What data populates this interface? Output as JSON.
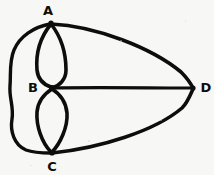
{
  "figure": {
    "kind": "hand-drawn-multigraph-diagram",
    "background_color": "#f7f7f5",
    "stroke_color": "#0d0d0d",
    "width": 214,
    "height": 175
  },
  "vertices": [
    {
      "id": "A",
      "label": "A",
      "x": 51,
      "y": 23,
      "label_x": 48,
      "label_y": 10
    },
    {
      "id": "B",
      "label": "B",
      "x": 52,
      "y": 88,
      "label_x": 33,
      "label_y": 87
    },
    {
      "id": "C",
      "label": "C",
      "x": 52,
      "y": 153,
      "label_x": 52,
      "label_y": 166
    },
    {
      "id": "D",
      "label": "D",
      "x": 193,
      "y": 88,
      "label_x": 206,
      "label_y": 87
    }
  ],
  "edges": [
    {
      "id": "AB-left",
      "from": "A",
      "to": "B",
      "shape": "arc-bulge-left",
      "path": "M51,24 C38,40 36,58 37,70 C38,80 45,85 51,87"
    },
    {
      "id": "AB-right",
      "from": "A",
      "to": "B",
      "shape": "arc-bulge-right",
      "path": "M51,24 C62,38 66,56 66,70 C66,80 59,86 52,88"
    },
    {
      "id": "BC-left",
      "from": "B",
      "to": "C",
      "shape": "arc-bulge-left",
      "path": "M52,89 C44,94 38,101 37,112 C36,126 42,143 51,152"
    },
    {
      "id": "BC-right",
      "from": "B",
      "to": "C",
      "shape": "arc-bulge-right",
      "path": "M52,89 C60,94 66,102 67,113 C68,127 60,144 52,152"
    },
    {
      "id": "AC-outer",
      "from": "A",
      "to": "C",
      "shape": "outer-left-wavy-curve",
      "path": "M50,24 C34,27 20,36 14,50 C9,62 11,74 10,86 C9,98 14,107 12,119 C10,131 14,145 26,150 C34,153 44,153 51,153"
    },
    {
      "id": "AD-top",
      "from": "A",
      "to": "D",
      "shape": "arc-bulge-up",
      "path": "M51,24 C96,26 152,48 181,72 C187,78 191,84 193,88"
    },
    {
      "id": "BD-mid",
      "from": "B",
      "to": "D",
      "shape": "straight",
      "path": "M52,88 C95,87 150,88 193,88"
    },
    {
      "id": "CD-bottom",
      "from": "C",
      "to": "D",
      "shape": "arc-bulge-down",
      "path": "M52,153 C100,148 155,131 182,108 C188,102 191,93 193,89"
    }
  ],
  "accessibility": {
    "description": "Hand-drawn multigraph with four labeled vertices A, B, C and D. A and B are joined by two parallel curved edges forming a lens; B and C are joined by two parallel curved edges forming a second lens; A connects to C by a large curve around the left side; A, B and C each connect to D on the right."
  }
}
